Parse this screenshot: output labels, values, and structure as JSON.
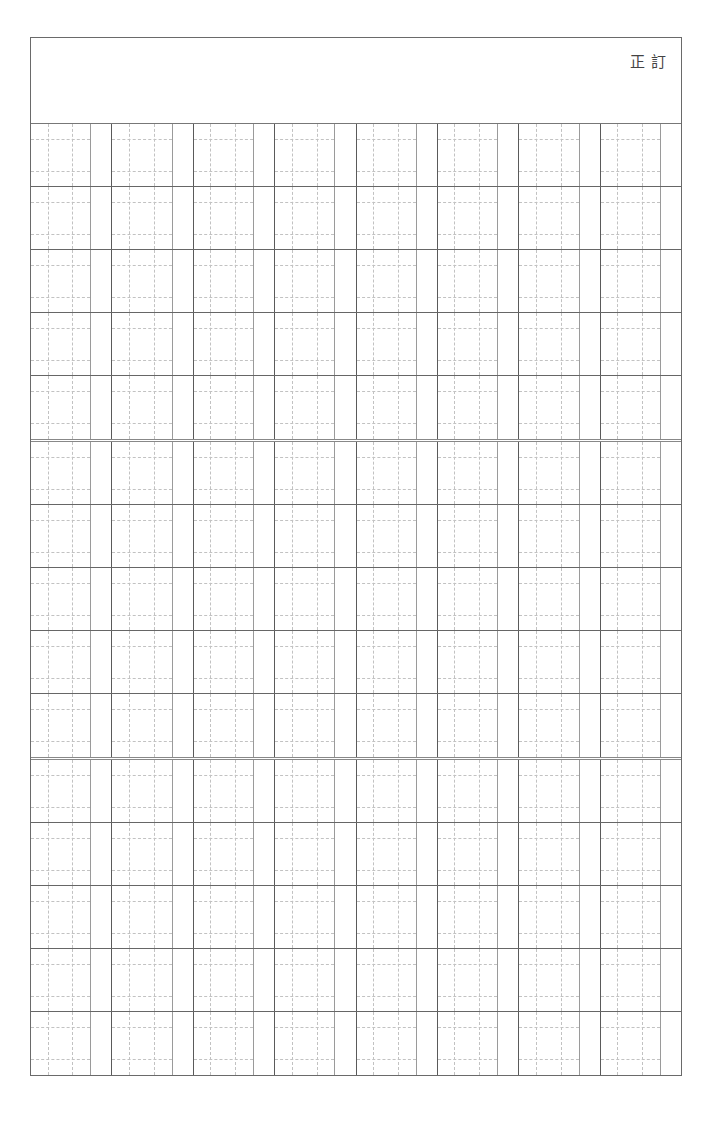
{
  "document": {
    "type": "genkou-youshi manuscript grid",
    "header": {
      "title": "訂正"
    },
    "grid": {
      "blocks": 3,
      "rows_per_block": 5,
      "columns": 8,
      "cell_layout": "square with 3x3 dashed guides + narrow ruby strip"
    }
  },
  "colors": {
    "border": "#6a6a6a",
    "row_line": "#666666",
    "column_line": "#5a5a5a",
    "square_edge": "#9a9a9a",
    "guide_dash": "#c2c2c2"
  }
}
